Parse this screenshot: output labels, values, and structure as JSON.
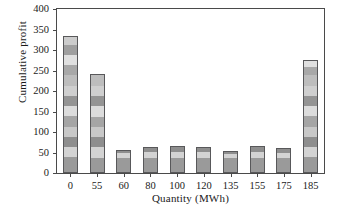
{
  "chart_data": {
    "type": "bar",
    "subtype": "stacked-bar",
    "title": "",
    "xlabel": "Quantity (MWh)",
    "ylabel": "Cumulative profit",
    "categories": [
      "0",
      "55",
      "60",
      "80",
      "100",
      "120",
      "135",
      "155",
      "175",
      "185"
    ],
    "values": [
      333,
      241,
      56,
      64,
      66,
      64,
      54,
      66,
      60,
      275
    ],
    "ylim": [
      0,
      400
    ],
    "yticks": [
      0,
      50,
      100,
      150,
      200,
      250,
      300,
      350,
      400
    ],
    "ytick_labels": [
      "0",
      "50",
      "100",
      "150",
      "200",
      "250",
      "300",
      "350",
      "400"
    ],
    "grid": false,
    "legend": "none",
    "stacks": [
      {
        "category": "0",
        "total": 333,
        "segments": [
          36,
          25,
          25,
          25,
          25,
          25,
          25,
          25,
          25,
          25,
          25,
          25,
          22
        ]
      },
      {
        "category": "55",
        "total": 241,
        "segments": [
          35,
          25,
          25,
          25,
          25,
          25,
          25,
          25,
          31
        ]
      },
      {
        "category": "60",
        "total": 56,
        "segments": [
          34,
          12,
          10
        ]
      },
      {
        "category": "80",
        "total": 64,
        "segments": [
          34,
          14,
          16
        ]
      },
      {
        "category": "100",
        "total": 66,
        "segments": [
          34,
          15,
          17
        ]
      },
      {
        "category": "120",
        "total": 64,
        "segments": [
          34,
          14,
          16
        ]
      },
      {
        "category": "135",
        "total": 54,
        "segments": [
          33,
          11,
          10
        ]
      },
      {
        "category": "155",
        "total": 66,
        "segments": [
          34,
          15,
          17
        ]
      },
      {
        "category": "175",
        "total": 60,
        "segments": [
          34,
          13,
          13
        ]
      },
      {
        "category": "185",
        "total": 275,
        "segments": [
          36,
          25,
          25,
          25,
          25,
          25,
          25,
          25,
          25,
          20,
          19
        ]
      }
    ],
    "segment_colors": [
      "#9a9a9a",
      "#d3d3d3",
      "#8e8e8e",
      "#c8c8c8",
      "#a5a5a5",
      "#dcdcdc",
      "#949494",
      "#cfcfcf",
      "#bdbdbd",
      "#a8a8a8",
      "#e0e0e0",
      "#9f9f9f",
      "#cccccc"
    ],
    "bar_edge_color": "#58585a",
    "axis_color": "#4a4a4a",
    "background": "#ffffff"
  }
}
